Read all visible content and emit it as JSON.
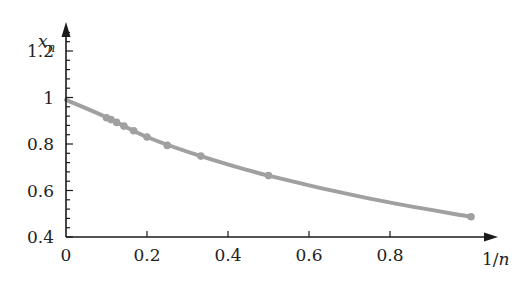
{
  "chart_data": {
    "type": "line",
    "title": "",
    "xlabel": "1/n",
    "ylabel": "x_n",
    "ylabel_main": "x",
    "ylabel_sub": "n",
    "xlabel_prefix": "1/",
    "xlabel_var": "n",
    "xlim": [
      0,
      1.05
    ],
    "ylim": [
      0.4,
      1.3
    ],
    "grid": false,
    "legend": null,
    "x_ticks": [
      0,
      0.2,
      0.4,
      0.6,
      0.8
    ],
    "x_tick_labels": [
      "0",
      "0.2",
      "0.4",
      "0.6",
      "0.8"
    ],
    "y_ticks": [
      0.4,
      0.6,
      0.8,
      1,
      1.2
    ],
    "y_tick_labels": [
      "0.4",
      "0.6",
      "0.8",
      "1",
      "1.2"
    ],
    "series": [
      {
        "name": "x_n",
        "color": "#a0a0a0",
        "curve_x": [
          0,
          0.1,
          0.2,
          0.333,
          0.5,
          0.75,
          1.0
        ],
        "curve_y": [
          0.99,
          0.915,
          0.83,
          0.748,
          0.664,
          0.565,
          0.487
        ],
        "points_x": [
          0.1,
          0.111,
          0.125,
          0.143,
          0.167,
          0.2,
          0.25,
          0.333,
          0.5,
          1.0
        ],
        "points_y": [
          0.913,
          0.905,
          0.893,
          0.877,
          0.857,
          0.83,
          0.794,
          0.748,
          0.664,
          0.487
        ]
      }
    ]
  }
}
